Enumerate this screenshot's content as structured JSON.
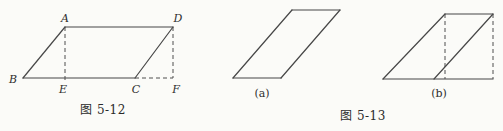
{
  "page": {
    "background_color": "#fbfbf8",
    "line_color": "#474747"
  },
  "figures": {
    "fig512": {
      "caption": "图 5-12",
      "vertex_labels": [
        {
          "text": "A"
        },
        {
          "text": "D"
        },
        {
          "text": "B"
        },
        {
          "text": "E"
        },
        {
          "text": "C"
        },
        {
          "text": "F"
        }
      ],
      "solid_lines": [
        [
          23,
          78,
          65,
          27
        ],
        [
          65,
          27,
          173,
          27
        ],
        [
          23,
          78,
          135,
          78
        ],
        [
          135,
          78,
          173,
          27
        ]
      ],
      "dashed_lines": [
        [
          65,
          27,
          65,
          81
        ],
        [
          173,
          27,
          173,
          78
        ],
        [
          135,
          78,
          173,
          78
        ]
      ]
    },
    "fig513": {
      "caption": "图 5-13",
      "sub_labels": [
        {
          "text": "(a)"
        },
        {
          "text": "(b)"
        }
      ]
    },
    "fig513a": {
      "solid_lines": [
        [
          233,
          78,
          292,
          10
        ],
        [
          292,
          10,
          340,
          10
        ],
        [
          340,
          10,
          281,
          78
        ],
        [
          281,
          78,
          233,
          78
        ]
      ]
    },
    "fig513b": {
      "solid_lines": [
        [
          383,
          79,
          445,
          14
        ],
        [
          445,
          14,
          493,
          14
        ],
        [
          383,
          79,
          493,
          79
        ],
        [
          434,
          79,
          493,
          14
        ]
      ],
      "dashed_lines": [
        [
          445,
          14,
          445,
          79
        ],
        [
          493,
          14,
          493,
          79
        ]
      ]
    }
  }
}
